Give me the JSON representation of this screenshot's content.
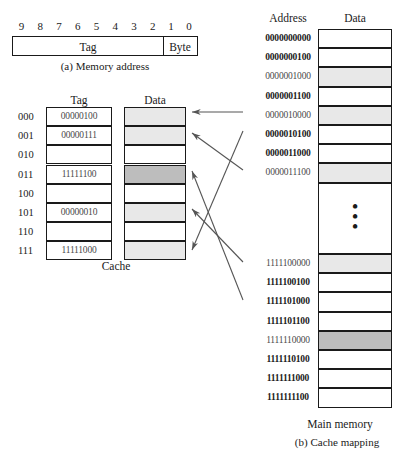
{
  "figure": {
    "part_a_caption": "(a) Memory address",
    "part_b_caption": "(b) Cache mapping",
    "cache_caption": "Cache",
    "main_memory_caption": "Main memory"
  },
  "address_format": {
    "bit_numbers": [
      "9",
      "8",
      "7",
      "6",
      "5",
      "4",
      "3",
      "2",
      "1",
      "0"
    ],
    "tag_field_label": "Tag",
    "byte_field_label": "Byte"
  },
  "cache": {
    "tag_header": "Tag",
    "data_header": "Data",
    "rows": [
      {
        "index": "000",
        "tag": "00000100",
        "shade": "light"
      },
      {
        "index": "001",
        "tag": "00000111",
        "shade": "light"
      },
      {
        "index": "010",
        "tag": "",
        "shade": "none"
      },
      {
        "index": "011",
        "tag": "11111100",
        "shade": "dark"
      },
      {
        "index": "100",
        "tag": "",
        "shade": "none"
      },
      {
        "index": "101",
        "tag": "00000010",
        "shade": "light"
      },
      {
        "index": "110",
        "tag": "",
        "shade": "none"
      },
      {
        "index": "111",
        "tag": "11111000",
        "shade": "light"
      }
    ]
  },
  "main_memory": {
    "address_header": "Address",
    "data_header": "Data",
    "rows": [
      {
        "address": "0000000000",
        "shade": "none"
      },
      {
        "address": "0000000100",
        "shade": "none"
      },
      {
        "address": "0000001000",
        "shade": "light"
      },
      {
        "address": "0000001100",
        "shade": "none"
      },
      {
        "address": "0000010000",
        "shade": "light"
      },
      {
        "address": "0000010100",
        "shade": "none"
      },
      {
        "address": "0000011000",
        "shade": "none"
      },
      {
        "address": "0000011100",
        "shade": "light"
      },
      {
        "address": "1111100000",
        "shade": "light"
      },
      {
        "address": "1111100100",
        "shade": "none"
      },
      {
        "address": "1111101000",
        "shade": "none"
      },
      {
        "address": "1111101100",
        "shade": "none"
      },
      {
        "address": "1111110000",
        "shade": "dark"
      },
      {
        "address": "1111110100",
        "shade": "none"
      },
      {
        "address": "1111111000",
        "shade": "none"
      },
      {
        "address": "1111111100",
        "shade": "none"
      }
    ],
    "ellipsis": "•"
  },
  "colors": {
    "light_shade": "#e8e8e8",
    "dark_shade": "#bdbdbd",
    "line": "#1a1a1a",
    "arrow": "#555555",
    "text": "#1a1a1a",
    "muted_text": "#4a4a4a"
  }
}
